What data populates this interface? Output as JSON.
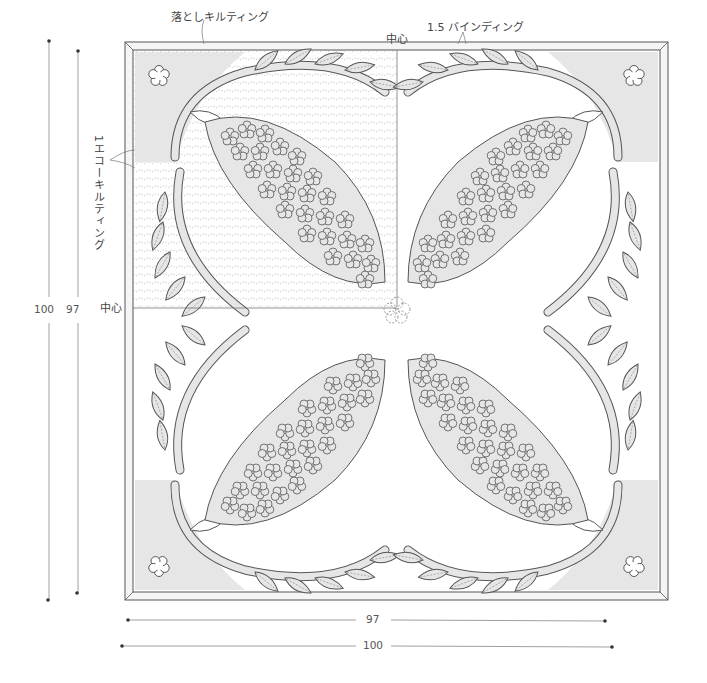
{
  "labels": {
    "drop_quilting": "落としキルティング",
    "binding": "1.5 バインディング",
    "center_top": "中心",
    "center_left": "中心",
    "echo_quilting": "1エコーキルティング"
  },
  "dimensions": {
    "inner_height": "97",
    "outer_height": "100",
    "inner_width": "97",
    "outer_width": "100"
  },
  "colors": {
    "line": "#555555",
    "fill": "#e6e6e6",
    "background": "#ffffff",
    "binding": "#f2f2f2"
  },
  "diagram": {
    "motif": "lilac/wisteria Hawaiian quilt applique",
    "quadrants": 4,
    "corner_flowers": 4
  }
}
